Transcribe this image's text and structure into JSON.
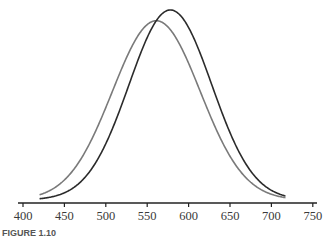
{
  "chart_data": {
    "type": "line",
    "title": "",
    "xlabel": "",
    "ylabel": "",
    "xlim": [
      400,
      750
    ],
    "xticks": [
      400,
      450,
      500,
      550,
      600,
      650,
      700,
      750
    ],
    "tick_labels": [
      "400",
      "450",
      "500",
      "550",
      "600",
      "650",
      "700",
      "750"
    ],
    "grid": false,
    "legend": "none",
    "y_axis_shown": false,
    "series": [
      {
        "name": "curve-a",
        "kind": "normal-density",
        "mean": 561,
        "sd": 53,
        "x_range": [
          420,
          717
        ],
        "color": "#7a7a7a"
      },
      {
        "name": "curve-b",
        "kind": "normal-density",
        "mean": 578,
        "sd": 50,
        "x_range": [
          420,
          717
        ],
        "color": "#2b2b2b"
      }
    ],
    "caption": "FIGURE 1.10"
  }
}
